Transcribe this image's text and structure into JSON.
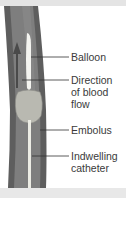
{
  "figure": {
    "labels": [
      {
        "id": "balloon",
        "text": "Balloon"
      },
      {
        "id": "direction",
        "lines": [
          "Direction",
          "of blood",
          "flow"
        ]
      },
      {
        "id": "embolus",
        "text": "Embolus"
      },
      {
        "id": "catheter",
        "lines": [
          "Indwelling",
          "catheter"
        ]
      }
    ],
    "colors": {
      "vessel_wall": "#5a5a5a",
      "vessel_lumen": "#7d7d7d",
      "embolus": "#b8b8b0",
      "catheter": "#e8e8e0",
      "leader_line": "#333333",
      "label_text": "#3a3a3a"
    }
  }
}
